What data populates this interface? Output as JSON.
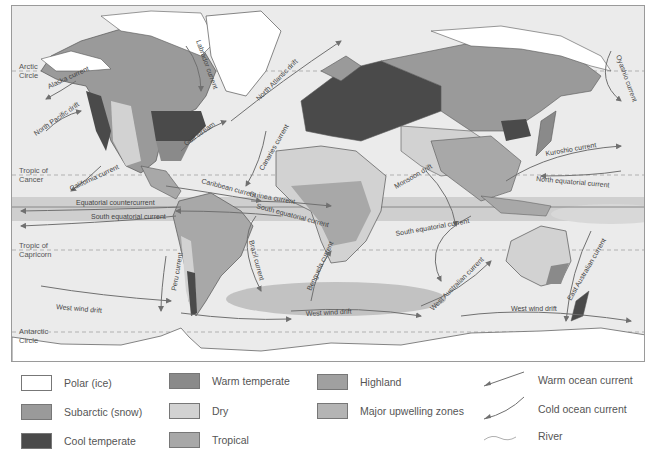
{
  "map": {
    "latitude_labels": {
      "arctic": "Arctic\nCircle",
      "tropic_cancer": "Tropic of\nCancer",
      "tropic_capricorn": "Tropic of\nCapricorn",
      "antarctic": "Antarctic\nCircle"
    },
    "currents": {
      "alaska": "Alaska current",
      "north_pacific_drift": "North Pacific drift",
      "california": "California current",
      "labrador": "Labrador current",
      "gulf_stream": "Gulf stream",
      "north_atlantic_drift": "North Atlantic drift",
      "canaries": "Canaries current",
      "caribbean": "Caribbean current",
      "guinea": "Guinea current",
      "equatorial_countercurrent": "Equatorial countercurrent",
      "south_equatorial_atlantic": "South equatorial current",
      "south_equatorial_pacific": "South equatorial current",
      "south_equatorial_indian": "South equatorial current",
      "peru": "Peru current",
      "brazil": "Brazil current",
      "benguela": "Benguela current",
      "monsoon_drift": "Monsoon drift",
      "west_australian": "West Australian current",
      "east_australian": "East Australian current",
      "kuroshio": "Kuroshio current",
      "oyashio": "Oyashio current",
      "north_equatorial_pacific": "North equatorial current",
      "west_wind_drift_1": "West wind drift",
      "west_wind_drift_2": "West wind drift",
      "west_wind_drift_3": "West wind drift",
      "west_wind_drift_4": "West wind drift"
    }
  },
  "legend": {
    "items": [
      {
        "label": "Polar (ice)",
        "color": "#ffffff"
      },
      {
        "label": "Subarctic (snow)",
        "color": "#9a9a9a"
      },
      {
        "label": "Cool temperate",
        "color": "#4a4a4a"
      },
      {
        "label": "Warm temperate",
        "color": "#8a8a8a"
      },
      {
        "label": "Dry",
        "color": "#d2d2d2"
      },
      {
        "label": "Tropical",
        "color": "#a8a8a8"
      },
      {
        "label": "Highland",
        "color": "#a0a0a0"
      },
      {
        "label": "Major upwelling zones",
        "color": "#b4b4b4"
      }
    ],
    "lines": [
      {
        "label": "Warm ocean current"
      },
      {
        "label": "Cold ocean current"
      },
      {
        "label": "River"
      }
    ]
  },
  "colors": {
    "ocean": "#ebebeb",
    "current_line": "#707070",
    "land_outline": "#555555"
  }
}
